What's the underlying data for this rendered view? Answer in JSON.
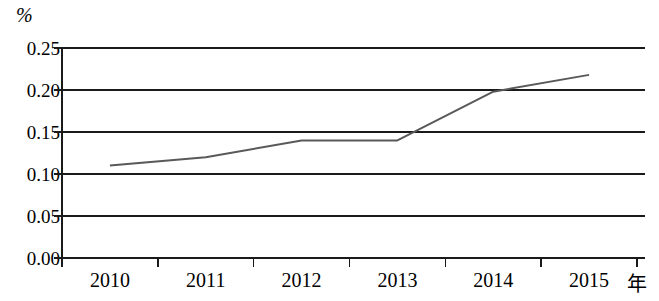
{
  "chart_data": {
    "type": "line",
    "title": "",
    "subtitle": "",
    "xlabel": "年",
    "ylabel": "%",
    "categories": [
      "2010",
      "2011",
      "2012",
      "2013",
      "2014",
      "2015"
    ],
    "series": [
      {
        "name": "",
        "values": [
          0.11,
          0.12,
          0.14,
          0.14,
          0.198,
          0.218
        ],
        "color": "#595959",
        "line_width": 2,
        "markers": false
      }
    ],
    "x": [
      2010,
      2011,
      2012,
      2013,
      2014,
      2015
    ],
    "xlim": [
      2009.5,
      2015.5
    ],
    "ylim": [
      0.0,
      0.25
    ],
    "ytick_labels": [
      "0.00",
      "0.05",
      "0.10",
      "0.15",
      "0.20",
      "0.25"
    ],
    "ytick_values": [
      0.0,
      0.05,
      0.1,
      0.15,
      0.2,
      0.25
    ],
    "grid": true,
    "grid_axis": "y",
    "legend": false,
    "legend_position": "none",
    "axis_color": "#1a1a1a",
    "grid_color": "#1a1a1a",
    "background": "#ffffff"
  },
  "figure": {
    "unit_label": "%",
    "x_axis_caption": "年"
  }
}
